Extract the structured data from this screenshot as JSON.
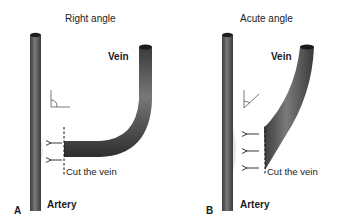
{
  "panels": [
    {
      "id": "A",
      "panel_label": "A",
      "title": "Right angle",
      "vein_label": "Vein",
      "artery_label": "Artery",
      "cut_label": "Cut the vein",
      "angle_type": "right",
      "arrow_count": 2
    },
    {
      "id": "B",
      "panel_label": "B",
      "title": "Acute angle",
      "vein_label": "Vein",
      "artery_label": "Artery",
      "cut_label": "Cut the vein",
      "angle_type": "acute",
      "arrow_count": 3
    }
  ],
  "colors": {
    "tube_dark": "#3a3a3a",
    "tube_mid": "#6a6a6a",
    "tube_light": "#9a9a9a",
    "background": "#ffffff",
    "text": "#1a1a1a"
  }
}
